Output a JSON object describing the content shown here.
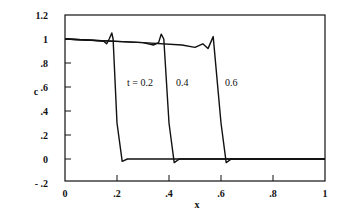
{
  "chart_data": {
    "type": "line",
    "title": "",
    "xlabel": "x",
    "ylabel": "c",
    "xlim": [
      0,
      1
    ],
    "ylim": [
      -0.2,
      1.2
    ],
    "grid": false,
    "legend": "none",
    "x_ticks": [
      "0",
      ".2",
      ".4",
      ".6",
      ".8",
      "1"
    ],
    "y_ticks": [
      "1.2",
      "1",
      ".8",
      ".6",
      ".4",
      ".2",
      "0",
      "- .2"
    ],
    "annotations": [
      "t = 0.2",
      "0.4",
      "0.6"
    ],
    "series": [
      {
        "name": "t = 0.2",
        "x": [
          0,
          0.1,
          0.15,
          0.16,
          0.17,
          0.18,
          0.185,
          0.2,
          0.22,
          0.24,
          1.0
        ],
        "y": [
          1.0,
          0.99,
          0.98,
          0.96,
          1.0,
          1.05,
          1.0,
          0.3,
          -0.02,
          0.0,
          0.0
        ]
      },
      {
        "name": "t = 0.4",
        "x": [
          0,
          0.2,
          0.3,
          0.34,
          0.36,
          0.37,
          0.38,
          0.4,
          0.42,
          0.44,
          1.0
        ],
        "y": [
          1.0,
          0.98,
          0.97,
          0.95,
          0.97,
          1.04,
          1.0,
          0.3,
          -0.03,
          0.0,
          0.0
        ]
      },
      {
        "name": "t = 0.6",
        "x": [
          0,
          0.3,
          0.45,
          0.5,
          0.53,
          0.55,
          0.56,
          0.57,
          0.6,
          0.62,
          0.64,
          1.0
        ],
        "y": [
          1.0,
          0.97,
          0.95,
          0.93,
          0.96,
          0.92,
          0.97,
          1.02,
          0.3,
          -0.03,
          0.0,
          0.0
        ]
      }
    ]
  }
}
